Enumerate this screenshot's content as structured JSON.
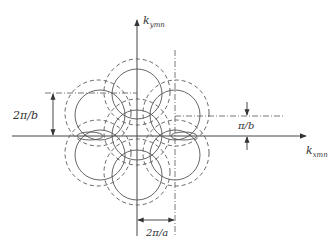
{
  "diagram": {
    "axes": {
      "x_label": "k",
      "x_sub": "xmn",
      "y_label": "k",
      "y_sub": "ymn"
    },
    "dimensions": {
      "vertical_period": "2π/b",
      "half_period": "π/b",
      "horizontal_period": "2π/a"
    },
    "colors": {
      "line": "#444444",
      "background": "#ffffff"
    }
  }
}
